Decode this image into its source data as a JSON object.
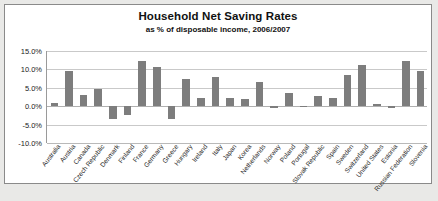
{
  "chart_data": {
    "type": "bar",
    "title": "Household Net Saving Rates",
    "subtitle": "as % of disposable income, 2006/2007",
    "xlabel": "",
    "ylabel": "",
    "ylim": [
      -10,
      15
    ],
    "grid": true,
    "legend": "none",
    "bar_color": "#7d7d7d",
    "ytick_labels": [
      "15.0%",
      "10.0%",
      "5.0%",
      "0.0%",
      "-5.0%",
      "-10.0%"
    ],
    "ytick_values": [
      15,
      10,
      5,
      0,
      -5,
      -10
    ],
    "categories": [
      "Australia",
      "Austria",
      "Canada",
      "Czech Republic",
      "Denmark",
      "Finland",
      "France",
      "Germany",
      "Greece",
      "Hungary",
      "Ireland",
      "Italy",
      "Japan",
      "Korea",
      "Netherlands",
      "Norway",
      "Poland",
      "Portugal",
      "Slovak Republic",
      "Spain",
      "Sweden",
      "Switzerland",
      "United States",
      "Estonia",
      "Russian Federation",
      "Slovenia"
    ],
    "values": [
      0.8,
      9.7,
      3.0,
      4.7,
      -3.5,
      -2.5,
      12.2,
      10.7,
      -3.4,
      7.5,
      2.3,
      8.0,
      2.2,
      1.9,
      6.5,
      -0.6,
      3.7,
      -0.3,
      2.7,
      2.2,
      8.4,
      11.3,
      0.5,
      -0.6,
      12.2,
      9.6
    ]
  }
}
